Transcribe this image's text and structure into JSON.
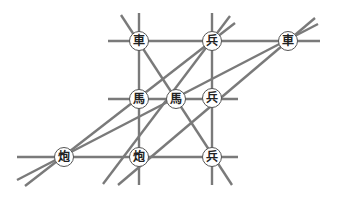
{
  "diagram": {
    "type": "xiangqi-piece-lines",
    "colors": {
      "line": "#7a7a7a",
      "piece_fill": "#ffffff",
      "piece_border": "#555555",
      "text": "#222222"
    },
    "pieces": [
      {
        "id": "chariot-top-left",
        "char": "車",
        "x": 139,
        "y": 41
      },
      {
        "id": "soldier-top",
        "char": "兵",
        "x": 212,
        "y": 41
      },
      {
        "id": "chariot-top-right",
        "char": "車",
        "x": 288,
        "y": 41
      },
      {
        "id": "horse-left",
        "char": "馬",
        "x": 139,
        "y": 99
      },
      {
        "id": "horse-center",
        "char": "馬",
        "x": 176,
        "y": 99
      },
      {
        "id": "soldier-middle",
        "char": "兵",
        "x": 212,
        "y": 98
      },
      {
        "id": "cannon-left",
        "char": "炮",
        "x": 64,
        "y": 157
      },
      {
        "id": "cannon-center",
        "char": "炮",
        "x": 139,
        "y": 157
      },
      {
        "id": "soldier-bottom",
        "char": "兵",
        "x": 212,
        "y": 157
      }
    ],
    "lines": [
      [
        108,
        41,
        320,
        41
      ],
      [
        108,
        99,
        238,
        99
      ],
      [
        17,
        157,
        238,
        157
      ],
      [
        139,
        13,
        139,
        185
      ],
      [
        212,
        13,
        212,
        185
      ],
      [
        121,
        15,
        232,
        185
      ],
      [
        25,
        186,
        235,
        23
      ],
      [
        17,
        180,
        318,
        24
      ],
      [
        103,
        184,
        230,
        16
      ],
      [
        118,
        185,
        315,
        18
      ]
    ]
  }
}
